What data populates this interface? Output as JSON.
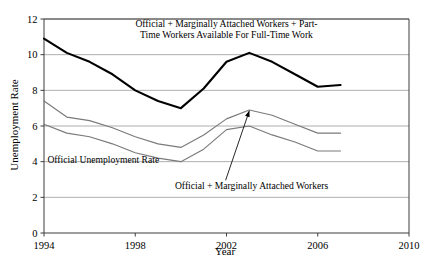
{
  "chart_data": {
    "type": "line",
    "title": "",
    "xlabel": "Year",
    "ylabel": "Unemployment Rate",
    "xlim": [
      1994,
      2010
    ],
    "ylim": [
      0,
      12
    ],
    "xticks": [
      1994,
      1998,
      2002,
      2006,
      2010
    ],
    "yticks": [
      0,
      2,
      4,
      6,
      8,
      10,
      12
    ],
    "grid": true,
    "legend_position": "none (inline annotations)",
    "x": [
      1994,
      1995,
      1996,
      1997,
      1998,
      1999,
      2000,
      2001,
      2002,
      2003,
      2004,
      2005,
      2006,
      2007
    ],
    "series": [
      {
        "name": "Official + Marginally Attached Workers + Part-Time Workers Available For Full-Time Work",
        "color": "#000000",
        "width": 2.1,
        "values": [
          10.9,
          10.1,
          9.6,
          8.9,
          8.0,
          7.4,
          7.0,
          8.1,
          9.6,
          10.1,
          9.6,
          8.9,
          8.2,
          8.3
        ]
      },
      {
        "name": "Official + Marginally Attached Workers",
        "color": "#7a7a7a",
        "width": 1.15,
        "values": [
          7.4,
          6.5,
          6.3,
          5.9,
          5.4,
          5.0,
          4.8,
          5.5,
          6.4,
          6.9,
          6.6,
          6.1,
          5.6,
          5.6
        ]
      },
      {
        "name": "Official Unemployment Rate",
        "color": "#7a7a7a",
        "width": 1.15,
        "values": [
          6.1,
          5.6,
          5.4,
          5.0,
          4.5,
          4.2,
          4.0,
          4.7,
          5.8,
          6.0,
          5.5,
          5.1,
          4.6,
          4.6
        ]
      }
    ],
    "annotations": [
      {
        "name": "u6-label",
        "lines": [
          "Official + Marginally Attached Workers + Part-",
          "Time Workers Available For Full-Time Work"
        ],
        "x": 2002.0,
        "y": 11.55
      },
      {
        "name": "official-label",
        "lines": [
          "Official Unemployment Rate"
        ],
        "x": 1994.15,
        "y": 3.9
      },
      {
        "name": "u5-label",
        "lines": [
          "Official + Marginally Attached Workers"
        ],
        "x": 2003.1,
        "y": 2.45,
        "arrow_to": {
          "x": 2003.0,
          "y": 6.85
        }
      }
    ]
  },
  "axis": {
    "y_title": "Unemployment Rate",
    "x_title": "Year",
    "y_tick_labels": [
      "0",
      "2",
      "4",
      "6",
      "8",
      "10",
      "12"
    ],
    "x_tick_labels": [
      "1994",
      "1998",
      "2002",
      "2006",
      "2010"
    ]
  },
  "colors": {
    "line_primary": "#000000",
    "line_secondary": "#7a7a7a",
    "grid": "#9a9a9a",
    "axis": "#3c3c3c",
    "background": "#ffffff"
  }
}
